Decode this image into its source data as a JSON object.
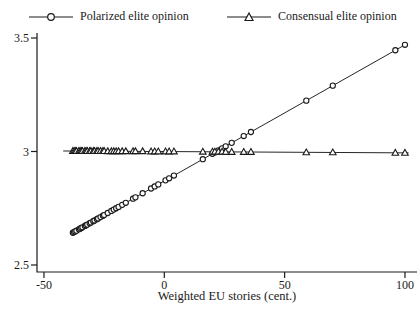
{
  "chart_data": {
    "type": "line",
    "title": "",
    "xlabel": "Weighted EU stories (cent.)",
    "ylabel": "",
    "xlim": [
      -55,
      107
    ],
    "ylim": [
      2.5,
      3.5
    ],
    "x_ticks": [
      -50,
      0,
      50,
      100
    ],
    "y_ticks": [
      3.5,
      3,
      2.5
    ],
    "grid": false,
    "legend_position": "top",
    "x": [
      -38,
      -37.5,
      -37,
      -36.5,
      -35.5,
      -35,
      -34.5,
      -34,
      -33,
      -32.5,
      -32,
      -31,
      -30.5,
      -29.5,
      -29,
      -28,
      -27.5,
      -26.5,
      -25.5,
      -25,
      -23.5,
      -22,
      -21,
      -20,
      -19,
      -17.5,
      -16,
      -13,
      -12,
      -9,
      -5.5,
      -4,
      -2.5,
      0.5,
      2,
      4,
      16,
      20,
      21,
      22.5,
      24,
      25.5,
      28,
      33,
      36,
      59,
      70,
      96,
      100
    ],
    "series": [
      {
        "name": "Polarized elite opinion",
        "marker": "circle",
        "line_x_extent": [
          -38,
          100
        ],
        "y": [
          2.642,
          2.645,
          2.648,
          2.651,
          2.657,
          2.66,
          2.663,
          2.666,
          2.672,
          2.675,
          2.678,
          2.684,
          2.687,
          2.693,
          2.696,
          2.702,
          2.705,
          2.711,
          2.717,
          2.72,
          2.729,
          2.738,
          2.744,
          2.75,
          2.756,
          2.765,
          2.774,
          2.792,
          2.798,
          2.816,
          2.837,
          2.846,
          2.855,
          2.873,
          2.882,
          2.894,
          2.966,
          2.99,
          2.996,
          3.005,
          3.014,
          3.023,
          3.038,
          3.068,
          3.086,
          3.224,
          3.29,
          3.446,
          3.47
        ]
      },
      {
        "name": "Consensual elite opinion",
        "marker": "triangle",
        "line_x_extent": [
          -42,
          101.5
        ],
        "y": [
          3.002,
          3.002,
          3.002,
          3.002,
          3.002,
          3.002,
          3.002,
          3.002,
          3.002,
          3.002,
          3.002,
          3.002,
          3.002,
          3.002,
          3.002,
          3.002,
          3.002,
          3.002,
          3.002,
          3.002,
          3.001,
          3.001,
          3.001,
          3.001,
          3.001,
          3.001,
          3.001,
          3.001,
          3.001,
          3.001,
          3.0,
          3.0,
          3.0,
          3.0,
          3.0,
          3.0,
          2.999,
          2.999,
          2.999,
          2.999,
          2.999,
          2.998,
          2.998,
          2.998,
          2.998,
          2.996,
          2.996,
          2.994,
          2.994
        ]
      }
    ],
    "colors": {
      "axis": "#1a1a1a",
      "line": "#262626",
      "marker_fill": "#ffffff"
    }
  }
}
